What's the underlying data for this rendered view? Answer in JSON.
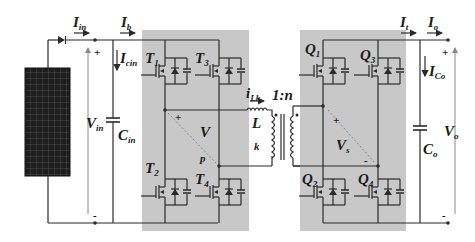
{
  "diagram": {
    "colors": {
      "wire": "#2a2a2a",
      "bridge_bg": "#c8c8c8",
      "arrow": "#8a8a8a",
      "diag": "#7a8a9a"
    },
    "labels": {
      "I_in": "I",
      "I_in_sub": "in",
      "I_b": "I",
      "I_b_sub": "b",
      "I_cin": "I",
      "I_cin_sub": "cin",
      "V_in": "V",
      "V_in_sub": "in",
      "C_in": "C",
      "C_in_sub": "in",
      "T1": "T",
      "T1_sub": "1",
      "T2": "T",
      "T2_sub": "2",
      "T3": "T",
      "T3_sub": "3",
      "T4": "T",
      "T4_sub": "4",
      "V": "V",
      "p": "p",
      "i_Lk": "i",
      "i_Lk_sub": "Lk",
      "L": "L",
      "k": "k",
      "ratio": "1:n",
      "Q1": "Q",
      "Q1_sub": "1",
      "Q2": "Q",
      "Q2_sub": "2",
      "Q3": "Q",
      "Q3_sub": "3",
      "Q4": "Q",
      "Q4_sub": "4",
      "V_s": "V",
      "V_s_sub": "s",
      "I_t": "I",
      "I_t_sub": "t",
      "I_o": "I",
      "I_o_sub": "o",
      "I_Co": "I",
      "I_Co_sub": "Co",
      "C_o": "C",
      "C_o_sub": "o",
      "V_o": "V",
      "V_o_sub": "o",
      "plus": "+",
      "minus": "-"
    }
  }
}
